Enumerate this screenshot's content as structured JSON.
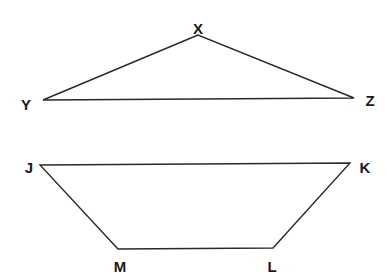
{
  "triangle": {
    "vertices": [
      {
        "label": "X",
        "x": 198,
        "y": 35,
        "lx": 198,
        "ly": 34
      },
      {
        "label": "Y",
        "x": 43,
        "y": 100,
        "lx": 26,
        "ly": 110
      },
      {
        "label": "Z",
        "x": 354,
        "y": 98,
        "lx": 370,
        "ly": 106
      }
    ]
  },
  "trapezoid": {
    "vertices": [
      {
        "label": "J",
        "x": 40,
        "y": 165,
        "lx": 29,
        "ly": 173
      },
      {
        "label": "K",
        "x": 350,
        "y": 163,
        "lx": 365,
        "ly": 173
      },
      {
        "label": "L",
        "x": 273,
        "y": 248,
        "lx": 272,
        "ly": 272
      },
      {
        "label": "M",
        "x": 118,
        "y": 249,
        "lx": 120,
        "ly": 272
      }
    ]
  },
  "colors": {
    "stroke": "#2a2a2a",
    "text": "#1a1a1a",
    "background": "#ffffff"
  }
}
